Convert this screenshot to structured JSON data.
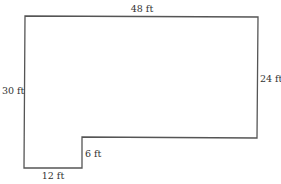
{
  "diagram": {
    "type": "floor-plan-outline",
    "shape": "L-shaped polygon (rectangle with lower-right section removed)",
    "stroke_color": "#555555",
    "text_color": "#333333",
    "dimensions": {
      "top": "48 ft",
      "left": "30 ft",
      "right": "24 ft",
      "step": "6 ft",
      "bottom": "12 ft"
    },
    "vertices": [
      [
        25,
        16
      ],
      [
        258,
        17
      ],
      [
        257,
        138
      ],
      [
        82,
        137
      ],
      [
        82,
        168
      ],
      [
        24,
        168
      ]
    ]
  }
}
